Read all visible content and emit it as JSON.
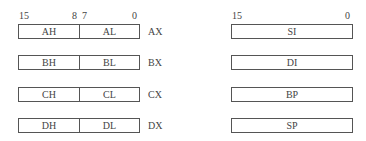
{
  "left_group": {
    "bits": {
      "b15": "15",
      "b8": "8",
      "b7": "7",
      "b0": "0"
    },
    "registers": [
      {
        "high": "AH",
        "low": "AL",
        "name": "AX"
      },
      {
        "high": "BH",
        "low": "BL",
        "name": "BX"
      },
      {
        "high": "CH",
        "low": "CL",
        "name": "CX"
      },
      {
        "high": "DH",
        "low": "DL",
        "name": "DX"
      }
    ]
  },
  "right_group": {
    "bits": {
      "b15": "15",
      "b0": "0"
    },
    "registers": [
      {
        "name": "SI"
      },
      {
        "name": "DI"
      },
      {
        "name": "BP"
      },
      {
        "name": "SP"
      }
    ]
  }
}
